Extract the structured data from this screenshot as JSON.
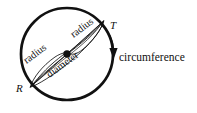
{
  "figure": {
    "type": "geometry-diagram",
    "background_color": "#ffffff",
    "stroke_color": "#111111",
    "width": 197,
    "height": 113
  },
  "circle": {
    "center_x": 67,
    "center_y": 54,
    "radius": 46,
    "stroke_width": 2.6,
    "center_dot_radius": 3.6,
    "center_dot_name": "center-point"
  },
  "points": [
    {
      "id": "R",
      "label": "R",
      "x": 20,
      "y": 88,
      "name": "point-label-r"
    },
    {
      "id": "T",
      "label": "T",
      "x": 112,
      "y": 26,
      "name": "point-label-t"
    }
  ],
  "segments": [
    {
      "id": "radius-left",
      "label": "radius",
      "from": "R",
      "to": "center",
      "label_x": 36,
      "label_y": 57,
      "rotation": -36
    },
    {
      "id": "radius-right",
      "label": "radius",
      "from": "center",
      "to": "T",
      "label_x": 83,
      "label_y": 30,
      "rotation": -36
    },
    {
      "id": "diameter",
      "label": "diameter",
      "from": "R",
      "to": "T",
      "label_x": 64,
      "label_y": 69,
      "rotation": -36
    }
  ],
  "annotations": [
    {
      "id": "circumference",
      "label": "circumference",
      "label_x": 119,
      "label_y": 58,
      "arrow": "curved-down-arrow-to-circle-edge"
    }
  ]
}
